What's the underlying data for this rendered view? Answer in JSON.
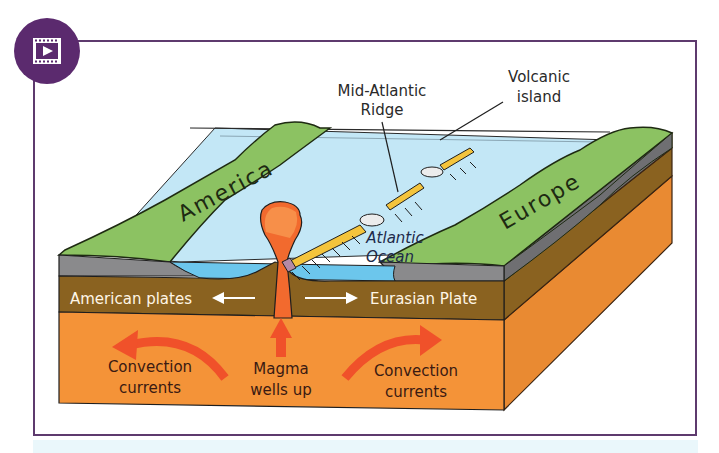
{
  "badge": {
    "icon": "video-play-icon",
    "color": "#5b2a6e"
  },
  "frame": {
    "border_color": "#5e3a6e"
  },
  "diagram": {
    "callouts": {
      "ridge_line1": "Mid-Atlantic",
      "ridge_line2": "Ridge",
      "island_line1": "Volcanic",
      "island_line2": "island"
    },
    "landmasses": {
      "left": "America",
      "right": "Europe"
    },
    "ocean": {
      "line1": "Atlantic",
      "line2": "Ocean"
    },
    "plates": {
      "left": "American plates",
      "right": "Eurasian Plate"
    },
    "mantle": {
      "left_line1": "Convection",
      "left_line2": "currents",
      "center_line1": "Magma",
      "center_line2": "wells up",
      "right_line1": "Convection",
      "right_line2": "currents"
    },
    "colors": {
      "land": "#8cc262",
      "ocean": "#bfe6f6",
      "ocean_deep": "#6cc6ec",
      "rock": "#8a8a8c",
      "crust": "#8a6220",
      "mantle": "#f49338",
      "magma": "#f2662a",
      "arrow": "#f0512a",
      "ridge": "#f4c43c",
      "text_dark": "#3a1a12",
      "text_light": "#fff6e6"
    }
  }
}
